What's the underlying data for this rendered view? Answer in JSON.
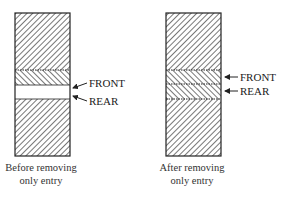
{
  "panels": [
    {
      "id": "before",
      "caption_line1": "Before removing",
      "caption_line2": "only entry",
      "segments": [
        {
          "role": "occupied",
          "hatch": "forward"
        },
        {
          "role": "entry",
          "hatch": "backward"
        },
        {
          "role": "empty",
          "hatch": "none"
        },
        {
          "role": "occupied",
          "hatch": "forward"
        }
      ],
      "pointers": [
        {
          "label": "FRONT"
        },
        {
          "label": "REAR"
        }
      ]
    },
    {
      "id": "after",
      "caption_line1": "After removing",
      "caption_line2": "only entry",
      "segments": [
        {
          "role": "occupied",
          "hatch": "forward"
        },
        {
          "role": "removed-entry",
          "hatch": "backward"
        },
        {
          "role": "slot",
          "hatch": "backward"
        },
        {
          "role": "occupied",
          "hatch": "forward"
        }
      ],
      "pointers": [
        {
          "label": "FRONT"
        },
        {
          "label": "REAR"
        }
      ]
    }
  ],
  "colors": {
    "stroke": "#222222",
    "hatch": "#555555",
    "background": "#ffffff"
  }
}
